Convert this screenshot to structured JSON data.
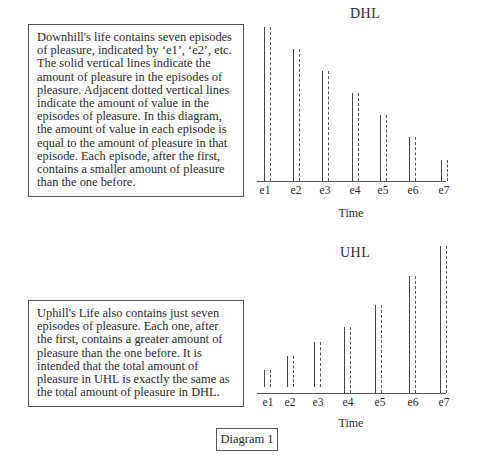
{
  "dhl_box": {
    "lines": [
      "Downhill's life contains seven episodes",
      "of pleasure, indicated by ‘e1’, ‘e2’, etc.",
      "The solid vertical lines indicate the",
      "amount of pleasure in the episodes of",
      "pleasure. Adjacent dotted vertical lines",
      "indicate the amount of value in the",
      "episodes of pleasure.  In this diagram,",
      "the amount of value in each episode is",
      "equal to the amount of pleasure in that",
      "episode.  Each episode, after the first,",
      "contains a smaller amount of pleasure",
      "than the one before."
    ]
  },
  "uhl_box": {
    "lines": [
      "Uphill's Life also contains just seven",
      "episodes of pleasure.  Each one, after",
      "the first, contains a greater amount of",
      "pleasure than the one before. It is",
      "intended that the total amount of",
      "pleasure in UHL is exactly the same as",
      "the total amount of pleasure in DHL."
    ]
  },
  "caption": "Diagram 1",
  "chart_data": [
    {
      "type": "bar",
      "title": "DHL",
      "xlabel": "Time",
      "ylabel": "",
      "categories": [
        "e1",
        "e2",
        "e3",
        "e4",
        "e5",
        "e6",
        "e7"
      ],
      "series": [
        {
          "name": "pleasure (solid)",
          "values": [
            154,
            132,
            110,
            88,
            66,
            44,
            21
          ]
        },
        {
          "name": "value (dotted)",
          "values": [
            154,
            132,
            110,
            88,
            66,
            44,
            21
          ]
        }
      ],
      "grid": false,
      "legend": "none"
    },
    {
      "type": "bar",
      "title": "UHL",
      "xlabel": "Time",
      "ylabel": "",
      "categories": [
        "e1",
        "e2",
        "e3",
        "e4",
        "e5",
        "e6",
        "e7"
      ],
      "series": [
        {
          "name": "pleasure (solid)",
          "values": [
            17,
            31,
            45,
            66,
            88,
            117,
            147
          ]
        },
        {
          "name": "value (dotted)",
          "values": [
            17,
            31,
            45,
            66,
            88,
            117,
            147
          ]
        }
      ],
      "grid": false,
      "legend": "none"
    }
  ],
  "dhl_chart": {
    "title": "DHL",
    "xlabel": "Time",
    "ticks": [
      "e1",
      "e2",
      "e3",
      "e4",
      "e5",
      "e6",
      "e7"
    ]
  },
  "uhl_chart": {
    "title": "UHL",
    "xlabel": "Time",
    "ticks": [
      "e1",
      "e2",
      "e3",
      "e4",
      "e5",
      "e6",
      "e7"
    ]
  }
}
